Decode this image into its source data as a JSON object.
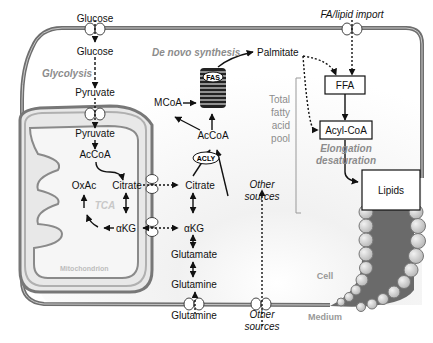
{
  "compartments": {
    "cell": "Cell",
    "medium": "Medium",
    "mitochondrion": "Mitochondrion",
    "tca": "TCA"
  },
  "metabolites": {
    "glucose_out": "Glucose",
    "glucose_in": "Glucose",
    "pyruvate_cyto": "Pyruvate",
    "pyruvate_mito": "Pyruvate",
    "accoa_mito": "AcCoA",
    "oxac": "OxAc",
    "citrate_mito": "Citrate",
    "akg_mito": "αKG",
    "citrate_cyto": "Citrate",
    "akg_cyto": "αKG",
    "glutamate": "Glutamate",
    "glutamine_in": "Glutamine",
    "glutamine_out": "Glutamine",
    "accoa_cyto": "AcCoA",
    "mcoa": "MCoA",
    "palmitate": "Palmitate",
    "ffa": "FFA",
    "acylcoa": "Acyl-CoA",
    "lipids": "Lipids"
  },
  "enzymes": {
    "fas": "FAS",
    "acly": "ACLY"
  },
  "processes": {
    "glycolysis": "Glycolysis",
    "de_novo": "De novo synthesis",
    "fa_import": "FA/lipid import",
    "elongation_1": "Elongation",
    "elongation_2": "desaturation",
    "other_sources_in_1": "Other",
    "other_sources_in_2": "sources",
    "other_sources_out_1": "Other",
    "other_sources_out_2": "sources"
  },
  "pool_label": [
    "Total",
    "fatty",
    "acid",
    "pool"
  ],
  "colors": {
    "membrane": "#6e6e6e",
    "membrane_inner": "#bdbdbd",
    "gray_text": "#8c8c8c",
    "mito_fill": "#e6e6e6",
    "lipid_bilayer": "#6a6a6a"
  }
}
